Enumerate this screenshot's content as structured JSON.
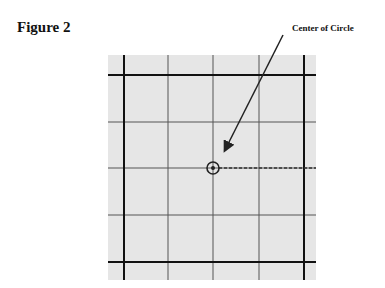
{
  "figure": {
    "title": "Figure 2",
    "callout_label": "Center of Circle"
  },
  "grid": {
    "background": "#e6e6e6",
    "box": {
      "x": 108,
      "y": 55,
      "width": 208,
      "height": 225
    },
    "thick_vertical_x": [
      124,
      304
    ],
    "thin_vertical_x": [
      168,
      213,
      259
    ],
    "thick_horizontal_y": [
      75,
      262
    ],
    "thin_horizontal_y": [
      122,
      168,
      215
    ]
  },
  "marker": {
    "cx": 213,
    "cy": 168,
    "outer_r": 6,
    "inner_r": 2
  },
  "dashed_line": {
    "x1": 219,
    "y1": 168,
    "x2": 316,
    "y2": 168
  },
  "arrow": {
    "x1": 283,
    "y1": 35,
    "x2": 225,
    "y2": 150
  }
}
